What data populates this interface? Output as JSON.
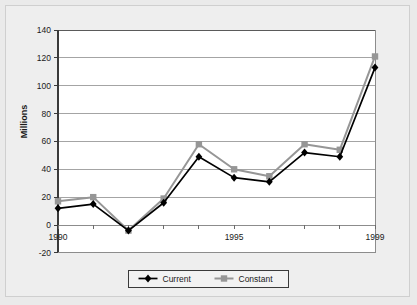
{
  "chart_data": {
    "type": "line",
    "title": "",
    "xlabel": "",
    "ylabel": "Millions",
    "x": [
      1990,
      1991,
      1992,
      1993,
      1994,
      1995,
      1996,
      1997,
      1998,
      1999
    ],
    "xtick_labels": [
      "1990",
      "1995",
      "1999"
    ],
    "xtick_values": [
      1990,
      1995,
      1999
    ],
    "xlim": [
      1990,
      1999
    ],
    "ylim": [
      -20,
      140
    ],
    "ytick_labels": [
      "140",
      "120",
      "100",
      "80",
      "60",
      "40",
      "20",
      "0",
      "-20"
    ],
    "ytick_values": [
      140,
      120,
      100,
      80,
      60,
      40,
      20,
      0,
      -20
    ],
    "grid": "horizontal",
    "legend_position": "bottom",
    "series": [
      {
        "name": "Current",
        "color": "#000000",
        "marker": "diamond",
        "values": [
          12,
          15,
          -4,
          16,
          49,
          34,
          31,
          52,
          49,
          113
        ]
      },
      {
        "name": "Constant",
        "color": "#969696",
        "marker": "square",
        "values": [
          17,
          20,
          -4,
          19,
          58,
          40,
          35,
          58,
          54,
          121
        ]
      }
    ]
  },
  "legend": {
    "items": [
      {
        "label": "Current"
      },
      {
        "label": "Constant"
      }
    ]
  },
  "colors": {
    "figure_background": "#eaeaea",
    "plot_background": "#ffffff",
    "grid": "#9a9a9a",
    "axis": "#4d4d4d",
    "series_current": "#000000",
    "series_constant": "#969696"
  }
}
